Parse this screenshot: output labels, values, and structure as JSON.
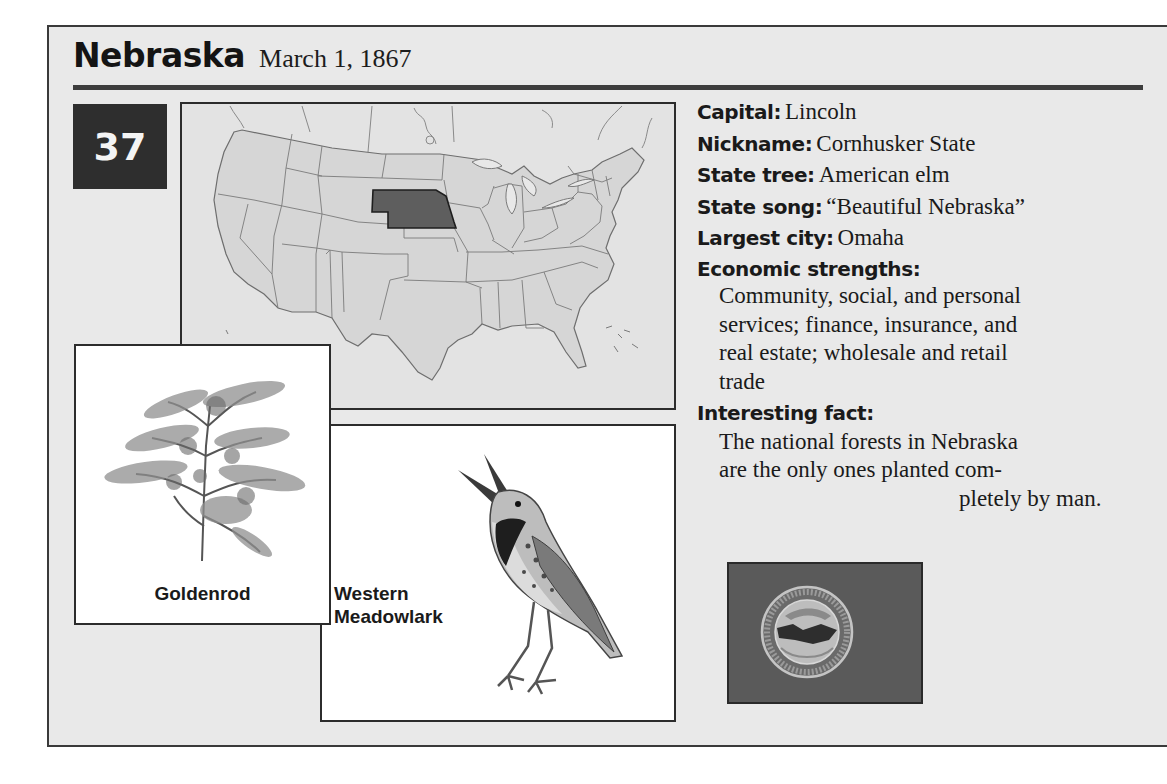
{
  "header": {
    "state_name": "Nebraska",
    "statehood_date": "March 1, 1867"
  },
  "order_badge": "37",
  "map": {
    "highlighted_state": "Nebraska",
    "colors": {
      "land": "#d6d6d6",
      "borders": "#6e6e6e",
      "highlight": "#5e5e5e",
      "water": "#e3e3e3"
    }
  },
  "flower": {
    "caption": "Goldenrod"
  },
  "bird": {
    "caption_line1": "Western",
    "caption_line2": "Meadowlark"
  },
  "facts": {
    "capital": {
      "label": "Capital:",
      "value": "Lincoln"
    },
    "nickname": {
      "label": "Nickname:",
      "value": "Cornhusker State"
    },
    "state_tree": {
      "label": "State tree:",
      "value": "American elm"
    },
    "state_song": {
      "label": "State song:",
      "value": "“Beautiful Nebraska”"
    },
    "largest_city": {
      "label": "Largest city:",
      "value": "Omaha"
    },
    "economic_strengths": {
      "label": "Economic strengths:",
      "lines": [
        "Community, social, and personal",
        "services; finance, insurance, and",
        "real estate; wholesale and retail",
        "trade"
      ]
    },
    "interesting_fact": {
      "label": "Interesting fact:",
      "lines": [
        "The national forests in Nebraska",
        "are the only ones planted com-",
        "pletely by man."
      ]
    }
  },
  "flag": {
    "seal_text": "GREAT SEAL OF THE STATE OF NEBRASKA",
    "colors": {
      "field": "#5a5a5a",
      "seal_ring": "#bdbdbd"
    }
  }
}
